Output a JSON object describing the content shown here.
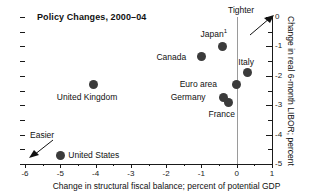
{
  "chart_data": {
    "type": "scatter",
    "title": "Policy Changes, 2000–04",
    "xlabel": "Change in structural fiscal balance; percent of potential GDP",
    "ylabel": "Change in real 6-month LIBOR; percent",
    "xlim": [
      -6,
      1
    ],
    "ylim": [
      -5,
      0
    ],
    "xticks": [
      -6,
      -5,
      -4,
      -3,
      -2,
      -1,
      0,
      1
    ],
    "xticklabels": [
      "-6",
      "-5",
      "-4",
      "-3",
      "-2",
      "-1",
      "0",
      "1"
    ],
    "yticks": [
      0,
      -1,
      -2,
      -3,
      -4,
      -5
    ],
    "yticklabels": [
      "0",
      "-1",
      "-2",
      "-3",
      "-4",
      "-5"
    ],
    "y_axis_position": "right",
    "grid": false,
    "legend": "none",
    "marker_color": "#3b3b3b",
    "points": [
      {
        "label": "Japan",
        "footnote": "1",
        "x": -0.4,
        "y": -1.0,
        "label_dx": -22,
        "label_dy": -17
      },
      {
        "label": "Canada",
        "footnote": "",
        "x": -1.0,
        "y": -1.35,
        "label_dx": -45,
        "label_dy": -5
      },
      {
        "label": "Italy",
        "footnote": "",
        "x": 0.3,
        "y": -1.9,
        "label_dx": -9,
        "label_dy": -16
      },
      {
        "label": "Euro area",
        "footnote": "",
        "x": 0.0,
        "y": -2.3,
        "label_dx": -57,
        "label_dy": -6
      },
      {
        "label": "Germany",
        "footnote": "",
        "x": -0.37,
        "y": -2.75,
        "label_dx": -53,
        "label_dy": -6
      },
      {
        "label": "France",
        "footnote": "",
        "x": -0.23,
        "y": -2.9,
        "label_dx": -20,
        "label_dy": 7
      },
      {
        "label": "United Kingdom",
        "footnote": "",
        "x": -4.05,
        "y": -2.3,
        "label_dx": -37,
        "label_dy": 7
      },
      {
        "label": "United States",
        "footnote": "",
        "x": -5.0,
        "y": -4.7,
        "label_dx": 8,
        "label_dy": -5
      }
    ],
    "annotations": [
      {
        "name": "tighter",
        "text": "Tighter",
        "direction": "up-right"
      },
      {
        "name": "easier",
        "text": "Easier",
        "direction": "down-left"
      }
    ]
  }
}
